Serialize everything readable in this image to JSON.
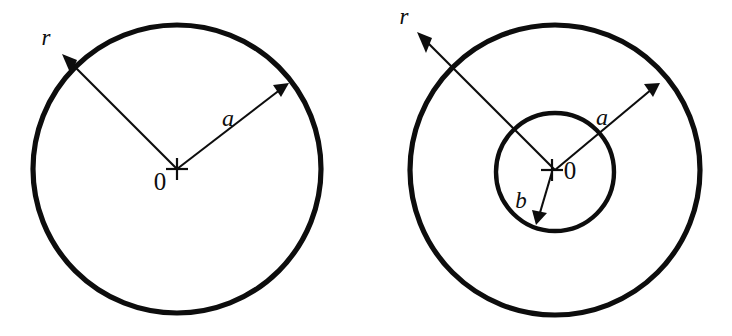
{
  "figure": {
    "background_color": "#ffffff",
    "stroke_color": "#0d0d0d",
    "width": 732,
    "height": 336,
    "panels": [
      {
        "id": "solid-cylinder",
        "name": "left-figure",
        "description": "Single circle cross-section with radial coordinate arrow and outer radius arrow",
        "center": {
          "x": 177,
          "y": 169
        },
        "circles": [
          {
            "name": "outer-circle",
            "radius": 144,
            "stroke_width": 5.2
          }
        ],
        "center_marker": {
          "name": "origin-cross",
          "glyph": "+",
          "x": 177,
          "y": 169,
          "arm": 11,
          "stroke_width": 2.2
        },
        "labels": [
          {
            "name": "origin-label",
            "text": "0",
            "x": 160,
            "y": 190,
            "size": 25,
            "style": "normal"
          },
          {
            "name": "radial-label-r",
            "text": "r",
            "x": 46,
            "y": 45,
            "size": 23,
            "style": "italic"
          },
          {
            "name": "radius-label-a",
            "text": "a",
            "x": 228,
            "y": 126,
            "size": 24,
            "style": "italic"
          }
        ],
        "arrows": [
          {
            "name": "radial-coordinate-arrow",
            "label": "r",
            "from": {
              "x": 177,
              "y": 169
            },
            "to": {
              "x": 62,
              "y": 54
            },
            "stroke_width": 2.1,
            "head_length": 15,
            "head_width": 10
          },
          {
            "name": "outer-radius-arrow",
            "label": "a",
            "from": {
              "x": 177,
              "y": 169
            },
            "to": {
              "x": 288,
              "y": 83
            },
            "stroke_width": 2.1,
            "head_length": 15,
            "head_width": 10
          }
        ]
      },
      {
        "id": "hollow-cylinder",
        "name": "right-figure",
        "description": "Annulus cross-section with radial coordinate arrow, outer radius arrow and inner radius arrow",
        "center": {
          "x": 555,
          "y": 170
        },
        "circles": [
          {
            "name": "outer-circle",
            "radius": 145,
            "stroke_width": 5.2
          },
          {
            "name": "inner-circle",
            "radius": 59,
            "stroke_width": 4.4,
            "center": {
              "x": 555,
              "y": 172
            }
          }
        ],
        "center_marker": {
          "name": "origin-cross",
          "glyph": "+",
          "x": 552,
          "y": 170,
          "arm": 11,
          "stroke_width": 2.2
        },
        "labels": [
          {
            "name": "origin-label",
            "text": "0",
            "x": 570,
            "y": 179,
            "size": 25,
            "style": "normal"
          },
          {
            "name": "radial-label-r",
            "text": "r",
            "x": 404,
            "y": 24,
            "size": 23,
            "style": "italic"
          },
          {
            "name": "outer-radius-label-a",
            "text": "a",
            "x": 602,
            "y": 125,
            "size": 24,
            "style": "italic"
          },
          {
            "name": "inner-radius-label-b",
            "text": "b",
            "x": 521,
            "y": 208,
            "size": 23,
            "style": "italic"
          }
        ],
        "arrows": [
          {
            "name": "radial-coordinate-arrow",
            "label": "r",
            "from": {
              "x": 555,
              "y": 170
            },
            "to": {
              "x": 417,
              "y": 32
            },
            "stroke_width": 2.1,
            "head_length": 15,
            "head_width": 10
          },
          {
            "name": "outer-radius-arrow",
            "label": "a",
            "from": {
              "x": 555,
              "y": 170
            },
            "to": {
              "x": 659,
              "y": 83
            },
            "stroke_width": 2.1,
            "head_length": 15,
            "head_width": 10
          },
          {
            "name": "inner-radius-arrow",
            "label": "b",
            "from": {
              "x": 552,
              "y": 172
            },
            "to": {
              "x": 536,
              "y": 224
            },
            "stroke_width": 2.1,
            "head_length": 14,
            "head_width": 10
          }
        ]
      }
    ]
  }
}
